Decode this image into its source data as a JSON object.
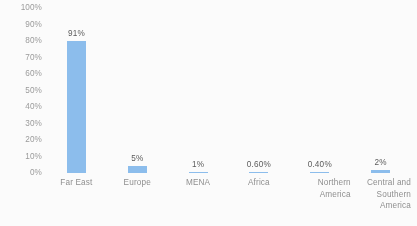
{
  "chart_data": {
    "type": "bar",
    "title": "",
    "subtitle": "",
    "xlabel": "",
    "ylabel": "",
    "categories": [
      "Far East",
      "Europe",
      "MENA",
      "Africa",
      "Northern America",
      "Central and Southern America"
    ],
    "category_lines": [
      [
        "Far East"
      ],
      [
        "Europe"
      ],
      [
        "MENA"
      ],
      [
        "Africa"
      ],
      [
        "Northern",
        "America"
      ],
      [
        "Central and",
        "Southern",
        "America"
      ]
    ],
    "values": [
      91,
      5,
      1,
      0.6,
      0.4,
      2
    ],
    "data_labels": [
      "91%",
      "5%",
      "1%",
      "0.60%",
      "0.40%",
      "2%"
    ],
    "ylim": [
      0,
      100
    ],
    "ytick_labels": [
      "100%",
      "90%",
      "80%",
      "70%",
      "60%",
      "50%",
      "40%",
      "30%",
      "20%",
      "10%",
      "0%"
    ],
    "ytick_values": [
      100,
      90,
      80,
      70,
      60,
      50,
      40,
      30,
      20,
      10,
      0
    ],
    "grid": false,
    "legend": false,
    "legend_position": "none",
    "bar_color": "#8cbfef",
    "label_color": "#5a5a5a",
    "axis_text_color": "#9c9c9c",
    "background_color": "#ffffff"
  }
}
